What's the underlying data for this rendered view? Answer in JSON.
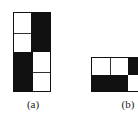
{
  "figures": [
    {
      "id": "a",
      "label": "(a)",
      "cols": 2,
      "rows": 4,
      "cells": [
        [
          "white",
          "black"
        ],
        [
          "white",
          "black"
        ],
        [
          "black",
          "white"
        ],
        [
          "black",
          "white"
        ]
      ]
    },
    {
      "id": "b",
      "label": "(b)",
      "cols": 3,
      "rows": 2,
      "cells": [
        [
          "white",
          "white",
          "black"
        ],
        [
          "black",
          "black",
          "white"
        ]
      ],
      "note_visible": "figure continues beyond right edge"
    }
  ],
  "colors": {
    "filled": "#111111",
    "empty": "#ffffff",
    "border": "#111111"
  }
}
